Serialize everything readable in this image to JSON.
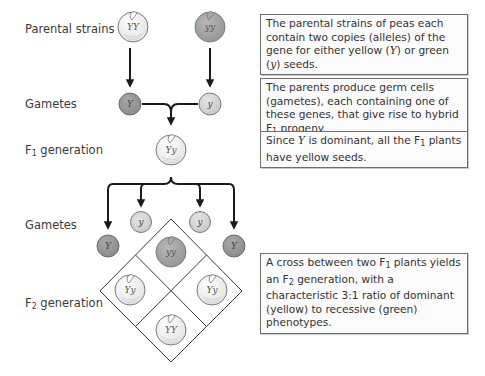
{
  "labels": {
    "parental": "Parental strains",
    "gametes_1": "Gametes",
    "f1_prefix": "F",
    "f1_sub": "1",
    "f1_suffix": " generation",
    "gametes_2": "Gametes",
    "f2_prefix": "F",
    "f2_sub": "2",
    "f2_suffix": " generation"
  },
  "boxes": [
    {
      "parts": [
        "The parental strains of peas each contain two copies (alleles) of the gene for either yellow (",
        "Y",
        ") or green (",
        "y",
        ") seeds."
      ]
    },
    {
      "parts": [
        "The parents produce germ cells (gametes), each containing one of these genes, that give rise to hybrid F",
        "1",
        " progeny."
      ]
    },
    {
      "parts": [
        "Since ",
        "Y",
        " is dominant, all the F",
        "1",
        " plants have yellow seeds."
      ]
    },
    {
      "parts": [
        "A cross between two F",
        "1",
        " plants yields an F",
        "2",
        " generation, with a characteristic 3:1 ratio of dominant (yellow) to recessive (green) phenotypes."
      ]
    }
  ],
  "peas": {
    "parent_left": "YY",
    "parent_right": "yy",
    "f1": "Yy",
    "f2_top": "yy",
    "f2_left": "Yy",
    "f2_right": "Yy",
    "f2_bottom": "YY"
  },
  "gametes": {
    "g1_left": "Y",
    "g1_right": "y",
    "g2_top_left": "y",
    "g2_top_right": "y",
    "g2_left": "Y",
    "g2_right": "Y"
  },
  "colors": {
    "yellow_pea_fill": "#f1f1f1",
    "green_pea_fill": "#a9a9a9",
    "dominant_gamete_fill": "#9a9a9a",
    "recessive_gamete_fill": "#d6d6d6",
    "stroke": "#7a7a7a",
    "arrow": "#1a1a1a"
  }
}
